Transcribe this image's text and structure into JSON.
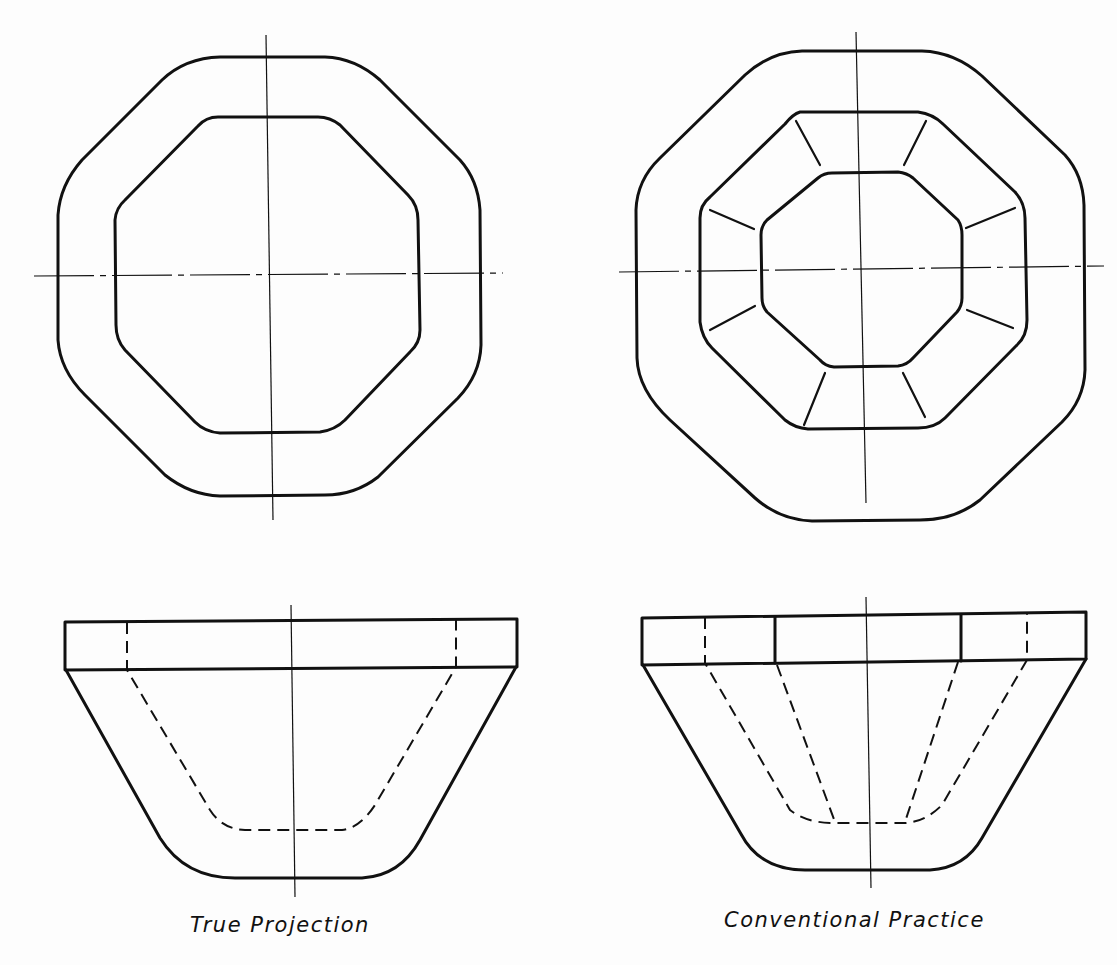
{
  "figure": {
    "left_caption": "True Projection",
    "right_caption": "Conventional Practice"
  },
  "views": [
    {
      "name": "true-projection",
      "top_view": "octagon ring (outer and inner octagon)",
      "front_view": "flange with tapered hollow body, hidden lines"
    },
    {
      "name": "conventional-practice",
      "top_view": "octagon ring with inner octagon and 8 radial ribs",
      "front_view": "flange with rib lines, tapered body, hidden lines"
    }
  ],
  "colors": {
    "line": "#111111",
    "background": "#fdfdfd"
  }
}
